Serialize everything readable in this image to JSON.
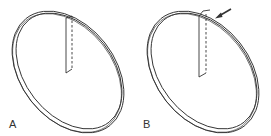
{
  "figure": {
    "panels": [
      {
        "label": "A",
        "description": "split ring with cut shown as dashed vertical slot",
        "has_arrow": false
      },
      {
        "label": "B",
        "description": "split ring with ends overlapped at notch, arrow indicating step",
        "has_arrow": true
      }
    ],
    "colors": {
      "line": "#333333",
      "background": "#ffffff"
    }
  }
}
